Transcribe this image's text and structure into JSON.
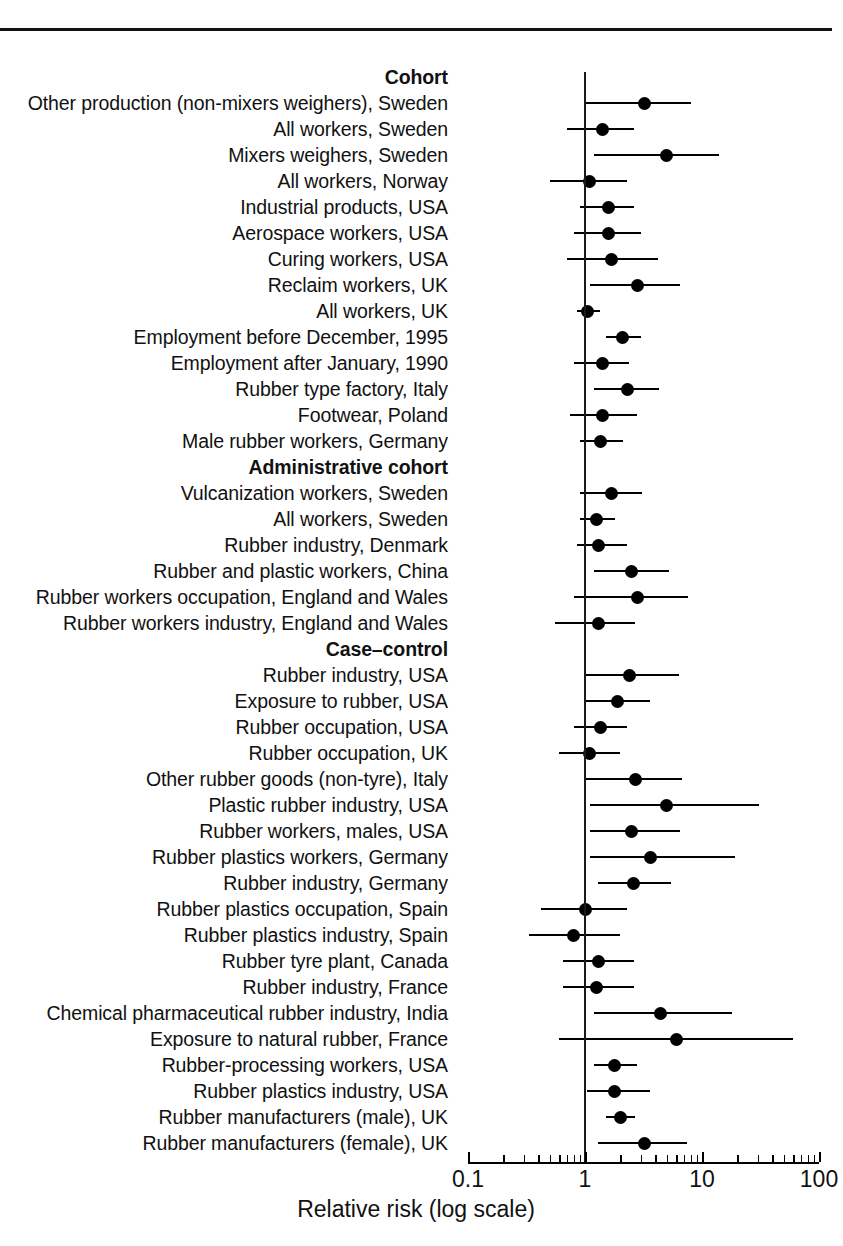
{
  "figure": {
    "axis_title": "Relative risk (log scale)",
    "axis_tick_labels": [
      "0.1",
      "1",
      "10",
      "100"
    ],
    "reference_line_value": 1,
    "scale": "log",
    "marker_color": "#000000",
    "line_color": "#000000"
  },
  "chart_data": {
    "type": "scatter",
    "title": "",
    "subtitle": "",
    "xlabel": "Relative risk (log scale)",
    "ylabel": "",
    "xscale": "log",
    "xlim": [
      0.1,
      100
    ],
    "xticks": [
      0.1,
      1,
      10,
      100
    ],
    "xticklabels": [
      "0.1",
      "1",
      "10",
      "100"
    ],
    "grid": false,
    "legend": "none",
    "annotations": [
      "Vertical reference line drawn at relative risk = 1"
    ],
    "group_headings": [
      "Cohort",
      "Administrative cohort",
      "Case–control"
    ],
    "rows": [
      {
        "type": "heading",
        "label": "Cohort"
      },
      {
        "type": "study",
        "label": "Other production (non-mixers weighers), Sweden",
        "rr": 3.2,
        "ci_low": 1.0,
        "ci_high": 8.0
      },
      {
        "type": "study",
        "label": "All workers, Sweden",
        "rr": 1.4,
        "ci_low": 0.7,
        "ci_high": 2.6
      },
      {
        "type": "study",
        "label": "Mixers weighers, Sweden",
        "rr": 5.0,
        "ci_low": 1.2,
        "ci_high": 14.0
      },
      {
        "type": "study",
        "label": "All workers, Norway",
        "rr": 1.1,
        "ci_low": 0.5,
        "ci_high": 2.3
      },
      {
        "type": "study",
        "label": "Industrial products, USA",
        "rr": 1.6,
        "ci_low": 0.9,
        "ci_high": 2.6
      },
      {
        "type": "study",
        "label": "Aerospace workers, USA",
        "rr": 1.6,
        "ci_low": 0.8,
        "ci_high": 3.0
      },
      {
        "type": "study",
        "label": "Curing workers, USA",
        "rr": 1.7,
        "ci_low": 0.7,
        "ci_high": 4.2
      },
      {
        "type": "study",
        "label": "Reclaim workers, UK",
        "rr": 2.8,
        "ci_low": 1.1,
        "ci_high": 6.5
      },
      {
        "type": "study",
        "label": "All workers, UK",
        "rr": 1.05,
        "ci_low": 0.85,
        "ci_high": 1.35
      },
      {
        "type": "study",
        "label": "Employment before December, 1995",
        "rr": 2.1,
        "ci_low": 1.5,
        "ci_high": 3.0
      },
      {
        "type": "study",
        "label": "Employment after January, 1990",
        "rr": 1.4,
        "ci_low": 0.8,
        "ci_high": 2.4
      },
      {
        "type": "study",
        "label": "Rubber type factory, Italy",
        "rr": 2.3,
        "ci_low": 1.2,
        "ci_high": 4.3
      },
      {
        "type": "study",
        "label": "Footwear, Poland",
        "rr": 1.4,
        "ci_low": 0.75,
        "ci_high": 2.8
      },
      {
        "type": "study",
        "label": "Male rubber workers, Germany",
        "rr": 1.35,
        "ci_low": 0.9,
        "ci_high": 2.1
      },
      {
        "type": "heading",
        "label": "Administrative cohort"
      },
      {
        "type": "study",
        "label": "Vulcanization workers, Sweden",
        "rr": 1.7,
        "ci_low": 0.9,
        "ci_high": 3.1
      },
      {
        "type": "study",
        "label": "All workers, Sweden",
        "rr": 1.25,
        "ci_low": 0.9,
        "ci_high": 1.8
      },
      {
        "type": "study",
        "label": "Rubber industry, Denmark",
        "rr": 1.3,
        "ci_low": 0.85,
        "ci_high": 2.3
      },
      {
        "type": "study",
        "label": "Rubber and plastic workers, China",
        "rr": 2.5,
        "ci_low": 1.2,
        "ci_high": 5.2
      },
      {
        "type": "study",
        "label": "Rubber workers occupation, England and Wales",
        "rr": 2.8,
        "ci_low": 0.8,
        "ci_high": 7.6
      },
      {
        "type": "study",
        "label": "Rubber workers industry, England and Wales",
        "rr": 1.3,
        "ci_low": 0.55,
        "ci_high": 2.7
      },
      {
        "type": "heading",
        "label": "Case–control"
      },
      {
        "type": "study",
        "label": "Rubber industry, USA",
        "rr": 2.4,
        "ci_low": 1.0,
        "ci_high": 6.3
      },
      {
        "type": "study",
        "label": "Exposure to rubber, USA",
        "rr": 1.9,
        "ci_low": 1.0,
        "ci_high": 3.6
      },
      {
        "type": "study",
        "label": "Rubber occupation, USA",
        "rr": 1.35,
        "ci_low": 0.8,
        "ci_high": 2.3
      },
      {
        "type": "study",
        "label": "Rubber occupation, UK",
        "rr": 1.1,
        "ci_low": 0.6,
        "ci_high": 2.0
      },
      {
        "type": "study",
        "label": "Other rubber goods (non-tyre), Italy",
        "rr": 2.7,
        "ci_low": 1.0,
        "ci_high": 6.8
      },
      {
        "type": "study",
        "label": "Plastic rubber industry, USA",
        "rr": 5.0,
        "ci_low": 1.1,
        "ci_high": 31.0
      },
      {
        "type": "study",
        "label": "Rubber workers, males, USA",
        "rr": 2.5,
        "ci_low": 1.1,
        "ci_high": 6.5
      },
      {
        "type": "study",
        "label": "Rubber plastics workers, Germany",
        "rr": 3.6,
        "ci_low": 1.1,
        "ci_high": 19.0
      },
      {
        "type": "study",
        "label": "Rubber industry, Germany",
        "rr": 2.6,
        "ci_low": 1.3,
        "ci_high": 5.4
      },
      {
        "type": "study",
        "label": "Rubber plastics occupation, Spain",
        "rr": 1.0,
        "ci_low": 0.42,
        "ci_high": 2.3
      },
      {
        "type": "study",
        "label": "Rubber plastics industry, Spain",
        "rr": 0.8,
        "ci_low": 0.33,
        "ci_high": 2.0
      },
      {
        "type": "study",
        "label": "Rubber tyre plant, Canada",
        "rr": 1.3,
        "ci_low": 0.65,
        "ci_high": 2.6
      },
      {
        "type": "study",
        "label": "Rubber industry, France",
        "rr": 1.25,
        "ci_low": 0.65,
        "ci_high": 2.6
      },
      {
        "type": "study",
        "label": "Chemical pharmaceutical rubber industry, India",
        "rr": 4.4,
        "ci_low": 1.2,
        "ci_high": 18.0
      },
      {
        "type": "study",
        "label": "Exposure to natural rubber, France",
        "rr": 6.0,
        "ci_low": 0.6,
        "ci_high": 60.0
      },
      {
        "type": "study",
        "label": "Rubber-processing workers, USA",
        "rr": 1.8,
        "ci_low": 1.2,
        "ci_high": 2.8
      },
      {
        "type": "study",
        "label": "Rubber plastics industry, USA",
        "rr": 1.8,
        "ci_low": 1.05,
        "ci_high": 3.6
      },
      {
        "type": "study",
        "label": "Rubber manufacturers (male), UK",
        "rr": 2.0,
        "ci_low": 1.5,
        "ci_high": 2.7
      },
      {
        "type": "study",
        "label": "Rubber manufacturers (female), UK",
        "rr": 3.2,
        "ci_low": 1.3,
        "ci_high": 7.5
      }
    ]
  }
}
